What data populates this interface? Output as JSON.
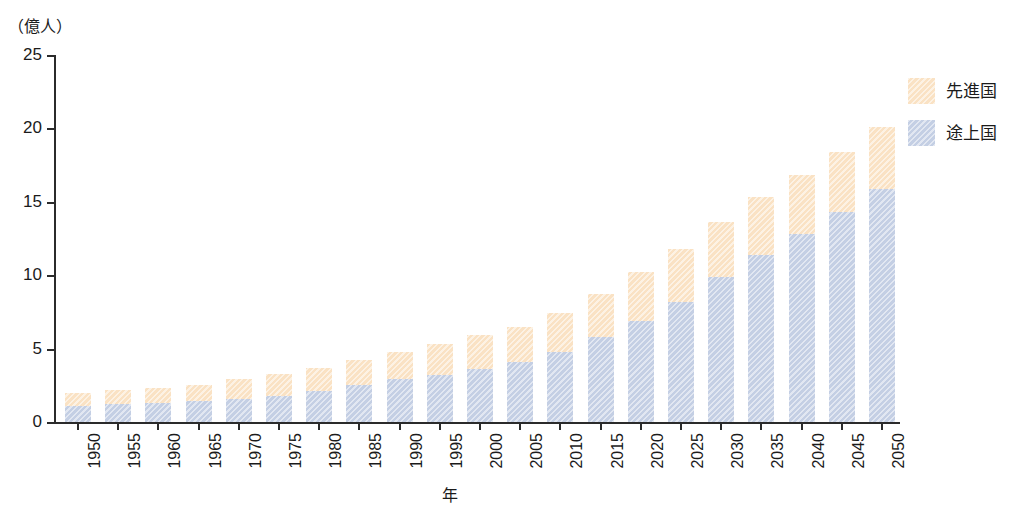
{
  "chart_data": {
    "type": "bar",
    "stacked": true,
    "title": "",
    "subtitle": "",
    "unit_label": "（億人）",
    "xlabel": "年",
    "ylabel": "",
    "ylim": [
      0,
      25
    ],
    "yticks": [
      0,
      5,
      10,
      15,
      20,
      25
    ],
    "ytick_labels": [
      "0",
      "5",
      "10",
      "15",
      "20",
      "25"
    ],
    "grid": false,
    "legend_position": "right",
    "categories": [
      "1950",
      "1955",
      "1960",
      "1965",
      "1970",
      "1975",
      "1980",
      "1985",
      "1990",
      "1995",
      "2000",
      "2005",
      "2010",
      "2015",
      "2020",
      "2025",
      "2030",
      "2035",
      "2040",
      "2045",
      "2050"
    ],
    "series": [
      {
        "name": "途上国",
        "color": "#c4cfe4",
        "values": [
          1.1,
          1.2,
          1.3,
          1.4,
          1.6,
          1.8,
          2.1,
          2.5,
          2.9,
          3.2,
          3.6,
          4.1,
          4.8,
          5.8,
          6.9,
          8.2,
          9.9,
          11.4,
          12.8,
          14.3,
          15.9
        ]
      },
      {
        "name": "先進国",
        "color": "#fae2c4",
        "values": [
          0.9,
          1.0,
          1.0,
          1.1,
          1.3,
          1.5,
          1.6,
          1.7,
          1.9,
          2.1,
          2.3,
          2.4,
          2.6,
          2.9,
          3.3,
          3.6,
          3.7,
          3.9,
          4.0,
          4.1,
          4.2
        ]
      }
    ],
    "totals": [
      2.0,
      2.2,
      2.3,
      2.5,
      2.9,
      3.3,
      3.7,
      4.2,
      4.8,
      5.3,
      5.9,
      6.5,
      7.4,
      8.7,
      10.2,
      11.8,
      13.6,
      15.3,
      16.8,
      18.4,
      20.1
    ]
  },
  "legend": {
    "items": [
      {
        "label": "先進国",
        "color": "#fae2c4"
      },
      {
        "label": "途上国",
        "color": "#c4cfe4"
      }
    ]
  }
}
